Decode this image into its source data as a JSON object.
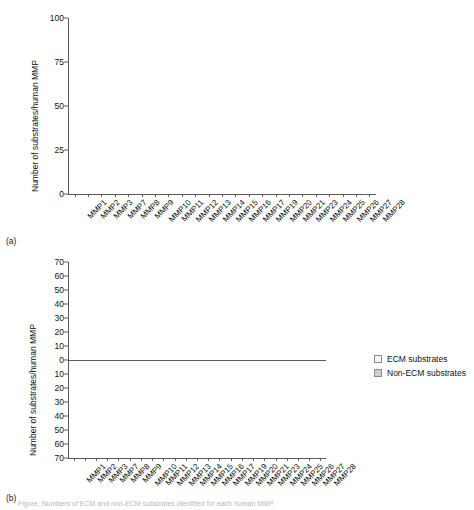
{
  "figure": {
    "panel_a_label": "(a)",
    "panel_b_label": "(b)",
    "bottom_caption": "Figure. Numbers of ECM and non-ECM substrates identified for each human MMP."
  },
  "chart_data": [
    {
      "id": "a",
      "type": "bar",
      "title": "",
      "xlabel": "",
      "ylabel": "Number of substrates/human MMP",
      "ylim": [
        0,
        100
      ],
      "yticks": [
        0,
        25,
        50,
        75,
        100
      ],
      "grid": false,
      "legend": null,
      "categories": [
        "MMP1",
        "MMP2",
        "MMP3",
        "MMP7",
        "MMP8",
        "MMP9",
        "MMP10",
        "MMP11",
        "MMP12",
        "MMP13",
        "MMP14",
        "MMP15",
        "MMP16",
        "MMP17",
        "MMP19",
        "MMP20",
        "MMP21",
        "MMP23",
        "MMP24",
        "MMP25",
        "MMP26",
        "MMP27",
        "MMP28"
      ],
      "values": [
        46,
        94,
        76,
        72,
        39,
        79,
        13,
        18,
        42,
        73,
        84,
        8,
        13,
        9,
        12,
        10,
        1,
        0,
        4,
        70,
        10,
        0,
        0
      ],
      "bar_color": "#6e6e6e"
    },
    {
      "id": "b",
      "type": "bar",
      "title": "",
      "xlabel": "",
      "ylabel": "Number of substrates/human MMP",
      "ylim": [
        -70,
        70
      ],
      "yticks": [
        70,
        60,
        50,
        40,
        30,
        20,
        10,
        0,
        10,
        20,
        30,
        40,
        50,
        60,
        70
      ],
      "grid": false,
      "legend_position": "right",
      "categories": [
        "MMP1",
        "MMP2",
        "MMP3",
        "MMP7",
        "MMP8",
        "MMP9",
        "MMP10",
        "MMP11",
        "MMP12",
        "MMP13",
        "MMP14",
        "MMP15",
        "MMP16",
        "MMP17",
        "MMP19",
        "MMP20",
        "MMP21",
        "MMP23",
        "MMP24",
        "MMP25",
        "MMP26",
        "MMP27",
        "MMP28"
      ],
      "series": [
        {
          "name": "ECM substrates",
          "color": "#eeeeee",
          "values": [
            11,
            27,
            24,
            14,
            6,
            17,
            6,
            0,
            16,
            23,
            18,
            3,
            3,
            2,
            6,
            9,
            0,
            1,
            0,
            13,
            3,
            0,
            0
          ]
        },
        {
          "name": "Non-ECM substrates",
          "color": "#cfcfcf",
          "values": [
            -35,
            -67,
            -52,
            -58,
            -32,
            -62,
            -5,
            -18,
            -26,
            -50,
            -66,
            -2,
            -8,
            -4,
            -4,
            -1,
            0,
            0,
            -2,
            -57,
            -3,
            0,
            0
          ]
        }
      ]
    }
  ]
}
